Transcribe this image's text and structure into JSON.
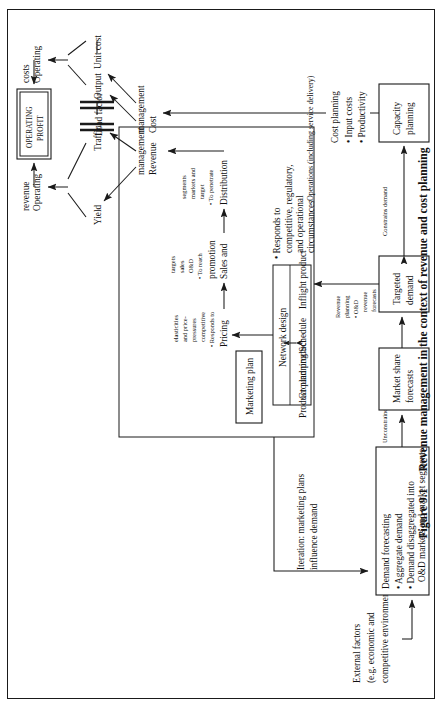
{
  "figure": {
    "number": "Figure 9.1",
    "caption": "Revenue management in the context of revenue and cost planning"
  },
  "nodes": {
    "external_factors": {
      "line1": "External factors",
      "line2": "(e.g. economic and",
      "line3": "competitive environments)"
    },
    "demand_forecasting": {
      "title": "Demand forecasting",
      "bullet1": "• Aggregate demand",
      "bullet2": "• Demand disaggregated into",
      "bullet3": "O&D markets and market segments"
    },
    "market_share_forecasts": {
      "line1": "Market share",
      "line2": "forecasts"
    },
    "targeted_demand": {
      "line1": "Targeted",
      "line2": "demand"
    },
    "capacity_planning": {
      "line1": "Capacity",
      "line2": "planning"
    },
    "marketing_plan": {
      "label": "Marketing plan"
    },
    "product_planning": {
      "label": "Product planning"
    },
    "ground_product": {
      "label": "Ground product"
    },
    "network_design": {
      "label": "Network design"
    },
    "schedule": {
      "label": "Schedule"
    },
    "inflight_product": {
      "label": "Inflight product"
    },
    "product_responds": {
      "line1": "• Responds to",
      "line2": "competitive, regulatory,",
      "line3": "and operational",
      "line4": "circumstances"
    },
    "pricing": {
      "label": "Pricing",
      "b1": "• Responds to",
      "b2": "competitive",
      "b3": "pressures",
      "b4": "and price-",
      "b5": "elasticities"
    },
    "sales_promotion": {
      "label1": "Sales and",
      "label2": "promotion",
      "b1": "• To reach",
      "b2": "O&D",
      "b3": "sales",
      "b4": "targets"
    },
    "distribution": {
      "label": "Distribution",
      "b1": "• To penetrate",
      "b2": "target",
      "b3": "markets and",
      "b4": "segments"
    },
    "revenue_management": {
      "line1": "Revenue",
      "line2": "management"
    },
    "cost_management": {
      "line1": "Cost",
      "line2": "management"
    },
    "yield": {
      "label": "Yield"
    },
    "traffic": {
      "label": "Traffic"
    },
    "load_factor": {
      "label": "Load factor"
    },
    "output": {
      "label": "Output"
    },
    "unit_cost": {
      "label": "Unit cost"
    },
    "operating_revenue": {
      "line1": "Operating",
      "line2": "revenue"
    },
    "operating_costs": {
      "line1": "Operating",
      "line2": "costs"
    },
    "operating_profit": {
      "line1": "OPERATING",
      "line2": "PROFIT"
    },
    "cost_planning": {
      "title": "Cost planning",
      "bullet1": "• Input costs",
      "bullet2": "• Productivity"
    }
  },
  "edge_labels": {
    "iteration": {
      "line1": "Iteration: marketing plans",
      "line2": "influence demand"
    },
    "unconstrained_demand": "Unconstrained demand",
    "revenue_planning": {
      "line1": "Revenue",
      "line2": "planning",
      "line3": "• O&D",
      "line4": "revenue",
      "line5": "forecasts"
    },
    "constrains_demand": "Constrains demand",
    "operations": "Operations (including service delivery)"
  },
  "colors": {
    "ink": "#1a1a1a",
    "paper": "#ffffff"
  }
}
